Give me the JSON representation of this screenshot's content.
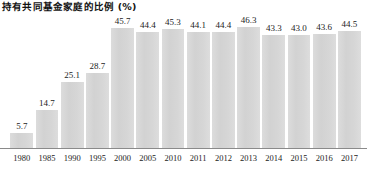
{
  "chart_data": {
    "type": "bar",
    "title": "持有共同基金家庭的比例 (%)",
    "xlabel": "",
    "ylabel": "",
    "ylim": [
      0,
      50
    ],
    "grid": false,
    "legend": "none",
    "bar_color": "#d6d6d6",
    "axis_color": "#8a8a8a",
    "categories": [
      "1980",
      "1985",
      "1990",
      "1995",
      "2000",
      "2005",
      "2010",
      "2011",
      "2012",
      "2013",
      "2014",
      "2015",
      "2016",
      "2017"
    ],
    "values": [
      5.7,
      14.7,
      25.1,
      28.7,
      45.7,
      44.4,
      45.3,
      44.1,
      44.4,
      46.3,
      43.3,
      43.0,
      43.6,
      44.5
    ],
    "value_labels": [
      "5.7",
      "14.7",
      "25.1",
      "28.7",
      "45.7",
      "44.4",
      "45.3",
      "44.1",
      "44.4",
      "46.3",
      "43.3",
      "43.0",
      "43.6",
      "44.5"
    ]
  }
}
